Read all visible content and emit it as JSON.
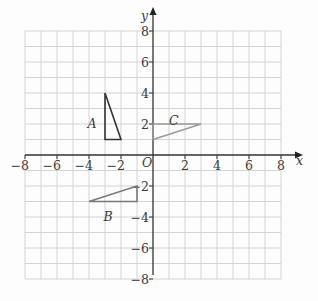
{
  "diagram": {
    "type": "coordinate-grid",
    "axes": {
      "x_label": "x",
      "y_label": "y",
      "origin_label": "O",
      "x_range": [
        -8,
        8
      ],
      "y_range": [
        -8,
        8
      ],
      "x_ticks": [
        "−8",
        "−6",
        "−4",
        "−2",
        "2",
        "4",
        "6",
        "8"
      ],
      "y_ticks": [
        "8",
        "6",
        "4",
        "2",
        "−2",
        "−4",
        "−6",
        "−8"
      ]
    },
    "shapes": [
      {
        "label": "A",
        "vertices": [
          [
            -3,
            4
          ],
          [
            -3,
            1
          ],
          [
            -2,
            1
          ]
        ],
        "color": "#333333"
      },
      {
        "label": "B",
        "vertices": [
          [
            -4,
            -3
          ],
          [
            -1,
            -3
          ],
          [
            -1,
            -2
          ]
        ],
        "color": "#7a7a7a"
      },
      {
        "label": "C",
        "vertices": [
          [
            0,
            1
          ],
          [
            3,
            2
          ],
          [
            0,
            2
          ]
        ],
        "color": "#9a9a9a"
      }
    ],
    "colors": {
      "grid": "#d4d4d4",
      "axes": "#333333",
      "text": "#3a3a3a"
    }
  }
}
